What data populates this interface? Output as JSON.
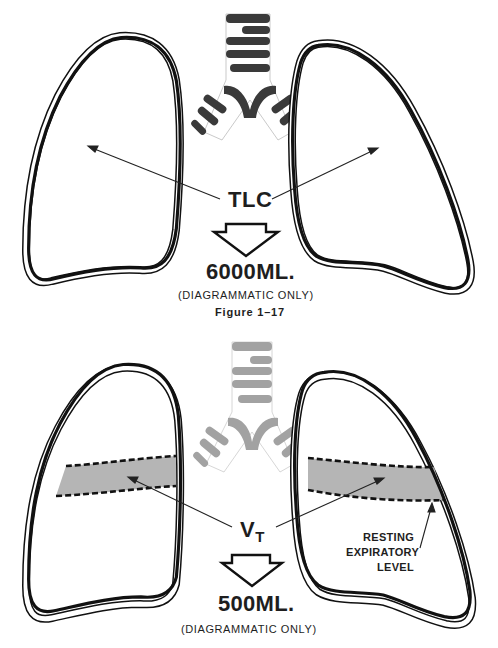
{
  "figure_top": {
    "label": "TLC",
    "volume": "6000ML.",
    "note": "(DIAGRAMMATIC ONLY)",
    "caption": "Figure 1–17"
  },
  "figure_bottom": {
    "label_main": "V",
    "label_sub": "T",
    "volume": "500ML.",
    "note": "(DIAGRAMMATIC ONLY)",
    "annotation": {
      "line1": "RESTING",
      "line2": "EXPIRATORY",
      "line3": "LEVEL"
    }
  },
  "colors": {
    "outline": "#111111",
    "trachea_top": "#3a3a3a",
    "trachea_bottom": "#a0a0a0",
    "tidal_band": "#b5b5b5"
  }
}
